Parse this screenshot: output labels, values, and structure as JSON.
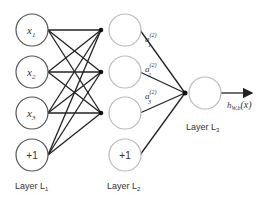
{
  "diagram": {
    "type": "neural-network",
    "layers": [
      {
        "label": "Layer L",
        "sub": "1",
        "nodes": [
          {
            "text": "x",
            "sub": "1"
          },
          {
            "text": "x",
            "sub": "2"
          },
          {
            "text": "x",
            "sub": "3"
          },
          {
            "text": "+1",
            "sub": ""
          }
        ]
      },
      {
        "label": "Layer L",
        "sub": "2",
        "nodes": [
          {
            "text": "",
            "sub": ""
          },
          {
            "text": "",
            "sub": ""
          },
          {
            "text": "",
            "sub": ""
          },
          {
            "text": "+1",
            "sub": ""
          }
        ],
        "activations": [
          {
            "text": "a",
            "sub": "1",
            "sup": "(2)"
          },
          {
            "text": "a",
            "sub": "2",
            "sup": "(2)"
          },
          {
            "text": "a",
            "sub": "3",
            "sup": "(2)"
          }
        ]
      },
      {
        "label": "Layer L",
        "sub": "3",
        "nodes": [
          {
            "text": "",
            "sub": ""
          }
        ]
      }
    ],
    "output": {
      "text": "h",
      "sub": "W,b",
      "arg": "(x)"
    },
    "colors": {
      "input_stroke": "#555555",
      "hidden_stroke": "#bbbbbb",
      "edge": "#222222"
    }
  }
}
